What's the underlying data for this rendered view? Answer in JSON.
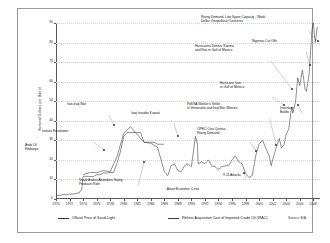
{
  "chart_data": {
    "type": "line",
    "title": "",
    "xlabel": "",
    "ylabel": "Nominal Dollars per Barrel",
    "xlim": [
      1970,
      2009
    ],
    "ylim": [
      0,
      90
    ],
    "yticks": [
      0,
      10,
      20,
      30,
      40,
      50,
      60,
      70,
      80,
      90
    ],
    "xticks": [
      "1970",
      "1972",
      "1974",
      "1976",
      "1978",
      "1980",
      "1982",
      "1984",
      "1986",
      "1988",
      "1990",
      "1992",
      "1994",
      "1996",
      "1998",
      "2000",
      "2002",
      "2004",
      "2006",
      "2008"
    ],
    "grid": true,
    "legend_position": "bottom",
    "series": [
      {
        "name": "Official Price of Saudi Light",
        "x": [
          1970.0,
          1970.5,
          1971.0,
          1971.5,
          1972.0,
          1972.5,
          1973.0,
          1973.4,
          1973.8,
          1974.0,
          1974.5,
          1975.0,
          1975.5,
          1976.0,
          1976.5,
          1977.0,
          1977.5,
          1978.0,
          1978.5,
          1979.0,
          1979.5,
          1980.0,
          1980.5,
          1981.0,
          1981.5,
          1982.0,
          1982.5,
          1983.0,
          1983.5,
          1984.0,
          1984.5,
          1985.0,
          1985.5,
          1986.0
        ],
        "values": [
          1.8,
          1.8,
          2.2,
          2.2,
          2.5,
          2.5,
          2.9,
          3.0,
          5.1,
          11.6,
          11.6,
          11.5,
          11.5,
          12.4,
          12.4,
          13.3,
          13.3,
          13.6,
          13.6,
          18.0,
          24.0,
          32.0,
          34.0,
          34.0,
          34.0,
          34.0,
          34.0,
          29.0,
          29.0,
          29.0,
          29.0,
          28.0,
          28.0,
          28.0
        ]
      },
      {
        "name": "Refiner Acquisition Cost of Imported Crude Oil (IRAC)",
        "x": [
          1974,
          1975,
          1976,
          1977,
          1978,
          1979,
          1980,
          1981,
          1982,
          1983,
          1984,
          1985,
          1986,
          1986.5,
          1987,
          1987.5,
          1988,
          1988.5,
          1989,
          1989.5,
          1990,
          1990.6,
          1990.9,
          1991,
          1991.5,
          1992,
          1992.5,
          1993,
          1993.5,
          1994,
          1994.5,
          1995,
          1995.5,
          1996,
          1996.5,
          1997,
          1997.5,
          1998,
          1998.5,
          1999,
          1999.5,
          2000,
          2000.5,
          2001,
          2001.5,
          2001.8,
          2002,
          2002.5,
          2003,
          2003.3,
          2003.7,
          2004,
          2004.4,
          2004.8,
          2005,
          2005.4,
          2005.7,
          2006,
          2006.4,
          2006.8,
          2007,
          2007.4,
          2007.8,
          2008,
          2008.3,
          2008.6
        ],
        "values": [
          12.5,
          13.5,
          13.5,
          14.5,
          14.0,
          21.5,
          33.5,
          37.0,
          33.0,
          29.0,
          28.5,
          26.5,
          14.0,
          12.0,
          17.0,
          18.0,
          14.5,
          14.0,
          17.0,
          18.0,
          16.5,
          32.0,
          28.0,
          18.0,
          19.0,
          18.0,
          20.0,
          17.0,
          16.5,
          15.0,
          16.5,
          17.0,
          17.0,
          20.0,
          22.0,
          19.0,
          18.0,
          13.0,
          11.0,
          12.0,
          22.0,
          28.0,
          30.0,
          26.0,
          22.0,
          17.0,
          20.0,
          26.0,
          31.0,
          26.0,
          28.0,
          33.0,
          36.0,
          47.0,
          44.0,
          50.0,
          62.0,
          58.0,
          66.0,
          56.0,
          55.0,
          64.0,
          86.0,
          90.0,
          80.0,
          88.0
        ]
      }
    ],
    "annotations": [
      {
        "id": "arab-oil-embargo",
        "text": "Arab Oil\nEmbargo",
        "x": 24,
        "y": 142,
        "align": "l",
        "leader": null
      },
      {
        "id": "iranian-revolution",
        "text": "Iranian Revolution",
        "x": 41,
        "y": 128,
        "align": "l",
        "leader": {
          "x1": 75,
          "y1": 133,
          "x2": 86,
          "y2": 141
        }
      },
      {
        "id": "iran-iraq-war",
        "text": "Iran-Iraq War",
        "x": 66,
        "y": 101,
        "align": "l",
        "leader": {
          "x1": 91,
          "y1": 106,
          "x2": 96,
          "y2": 116
        }
      },
      {
        "id": "saudi-swing-producer",
        "text": "Saudi Arabia Abandons Swing\nProducer Role",
        "x": 78,
        "y": 177,
        "align": "l",
        "leader": {
          "x1": 120,
          "y1": 177,
          "x2": 126,
          "y2": 153
        }
      },
      {
        "id": "iraq-invades-kuwait",
        "text": "Iraq Invades Kuwait",
        "x": 130,
        "y": 110,
        "align": "l",
        "leader": {
          "x1": 156,
          "y1": 115,
          "x2": 160,
          "y2": 127
        }
      },
      {
        "id": "asian-economic-crisis",
        "text": "Asian Economic Crisis",
        "x": 182,
        "y": 186,
        "align": "c",
        "leader": null
      },
      {
        "id": "nine-eleven-attacks",
        "text": "9-11 Attacks",
        "x": 222,
        "y": 172,
        "align": "l",
        "leader": {
          "x1": 228,
          "y1": 170,
          "x2": 226,
          "y2": 164
        }
      },
      {
        "id": "opec-cuts-quotas",
        "text": "OPEC Cuts Quotas,\nRising Demand",
        "x": 196,
        "y": 126,
        "align": "l",
        "leader": {
          "x1": 232,
          "y1": 133,
          "x2": 238,
          "y2": 142
        }
      },
      {
        "id": "pdvsa-strike-iraq-war",
        "text": "PdVSA Worker's Strike\nin Venezuela and Iraq War Worries",
        "x": 186,
        "y": 101,
        "align": "l",
        "leader": {
          "x1": 252,
          "y1": 110,
          "x2": 258,
          "y2": 136
        }
      },
      {
        "id": "hurricane-ivan",
        "text": "Hurricane Ivan\nin Gulf of Mexico",
        "x": 219,
        "y": 80,
        "align": "l",
        "leader": {
          "x1": 254,
          "y1": 88,
          "x2": 266,
          "y2": 96
        }
      },
      {
        "id": "hurricanes-dennis-katrina-rita",
        "text": "Hurricanes Dennis, Katrina\nand Rita in Gulf of Mexico",
        "x": 194,
        "y": 43,
        "align": "l",
        "leader": {
          "x1": 253,
          "y1": 52,
          "x2": 274,
          "y2": 80
        }
      },
      {
        "id": "inventory-builds",
        "text": "Inventory\nBuilds",
        "x": 279,
        "y": 105,
        "align": "l",
        "leader": {
          "x1": 284,
          "y1": 104,
          "x2": 280,
          "y2": 96
        }
      },
      {
        "id": "nigerian-cut-offs",
        "text": "Nigerian Cut Offs",
        "x": 251,
        "y": 38,
        "align": "l",
        "leader": {
          "x1": 288,
          "y1": 42,
          "x2": 292,
          "y2": 56
        }
      },
      {
        "id": "rising-demand-weak-dollar",
        "text": "Rising Demand, Low Spare Capacity , Weak\nDollar, Geopolitical Concerns",
        "x": 200,
        "y": 14,
        "align": "l",
        "leader": {
          "x1": 290,
          "y1": 22,
          "x2": 300,
          "y2": 32
        }
      }
    ]
  },
  "legend": {
    "items": [
      {
        "label": "Official Price of Saudi Light"
      },
      {
        "label": "Refiner Acquisition Cost of Imported Crude Oil (IRAC)"
      }
    ]
  },
  "source": {
    "text": "Source: EIA"
  }
}
